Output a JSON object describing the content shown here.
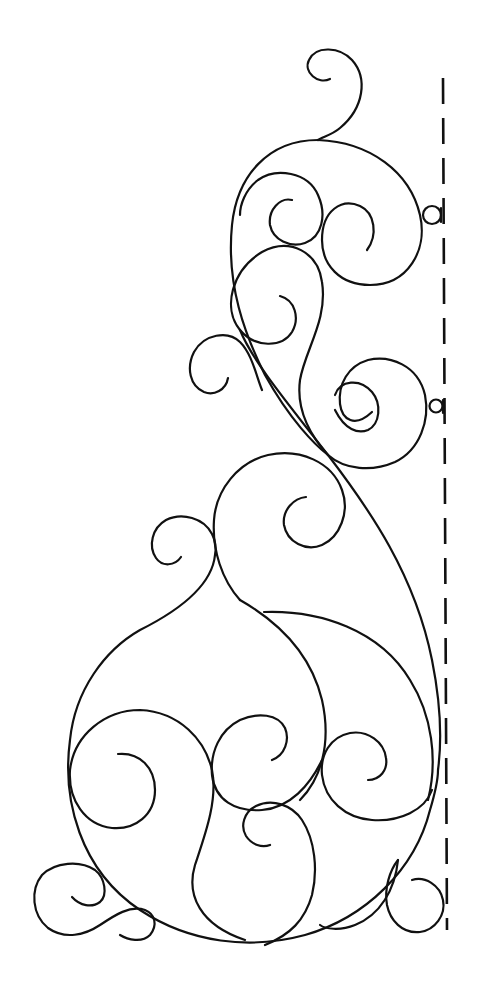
{
  "artwork": {
    "title": "Swirl quilting border pattern",
    "style": "black line art on white",
    "stroke_color": "#111111",
    "background_color": "#ffffff",
    "elements": {
      "fold_line": "dashed vertical placement line on right edge",
      "small_loops": 3,
      "large_base_circle": 1
    }
  }
}
